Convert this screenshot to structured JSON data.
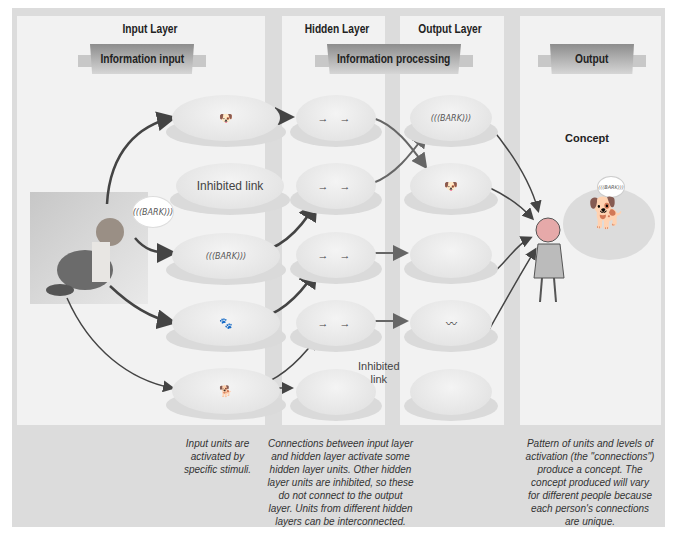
{
  "layers": {
    "input": {
      "title": "Input Layer",
      "banner": "Information input"
    },
    "hidden": {
      "title": "Hidden Layer"
    },
    "output": {
      "title": "Output Layer"
    },
    "processing_banner": "Information processing",
    "final": {
      "banner": "Output"
    }
  },
  "input_units": [
    {
      "content": "dog-head-image"
    },
    {
      "content": "Inhibited link"
    },
    {
      "content": "(((BARK)))"
    },
    {
      "content": "dog-legs-image"
    },
    {
      "content": "dog-body-image"
    }
  ],
  "hidden_units": [
    {
      "content": "→ →"
    },
    {
      "content": "→ →"
    },
    {
      "content": "→ →"
    },
    {
      "content": "→ →"
    },
    {
      "content": ""
    }
  ],
  "output_units": [
    {
      "content": "(((BARK)))"
    },
    {
      "content": "dog-face-image"
    },
    {
      "content": "dog-chest-image"
    },
    {
      "content": "dog-tail-image"
    },
    {
      "content": ""
    }
  ],
  "stimulus": {
    "bark": "(((BARK)))"
  },
  "inhibited_link_label": "Inhibited link",
  "inhibited_link_label_2_line1": "Inhibited",
  "inhibited_link_label_2_line2": "link",
  "concept": {
    "title": "Concept",
    "bark": "(((BARK)))"
  },
  "captions": {
    "input": [
      "Input units are",
      "activated by",
      "specific stimuli."
    ],
    "hidden": [
      "Connections between input layer",
      "and hidden layer activate some",
      "hidden layer units. Other hidden",
      "layer units are inhibited, so these",
      "do not connect to the output",
      "layer. Units from different hidden",
      "layers can be interconnected."
    ],
    "output": [
      "Pattern of units and levels of",
      "activation (the \"connections\")",
      "produce a concept. The",
      "concept produced will vary",
      "for different people because",
      "each person's connections",
      "are unique."
    ]
  }
}
